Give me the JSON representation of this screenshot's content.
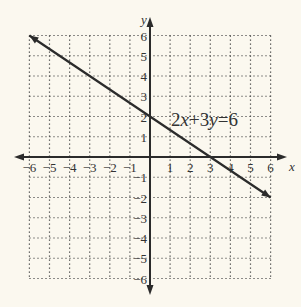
{
  "chart_data": {
    "type": "line",
    "title": "",
    "xlabel": "x",
    "ylabel": "y",
    "xlim": [
      -6,
      6
    ],
    "ylim": [
      -6,
      6
    ],
    "grid": true,
    "grid_style": "dotted",
    "x_ticks": [
      -6,
      -5,
      -4,
      -3,
      -2,
      -1,
      1,
      2,
      3,
      4,
      5,
      6
    ],
    "y_ticks": [
      -6,
      -5,
      -4,
      -3,
      -2,
      -1,
      1,
      2,
      3,
      4,
      5,
      6
    ],
    "x_tick_labels": [
      "−6",
      "−5",
      "−4",
      "−3",
      "−2",
      "−1",
      "1",
      "2",
      "3",
      "4",
      "5",
      "6"
    ],
    "y_tick_labels": [
      "−6",
      "−5",
      "−4",
      "−3",
      "−2",
      "−1",
      "1",
      "2",
      "3",
      "4",
      "5",
      "6"
    ],
    "series": [
      {
        "name": "2x+3y=6",
        "x": [
          -6,
          0,
          3,
          6
        ],
        "y": [
          6,
          2,
          0,
          -2
        ]
      }
    ],
    "annotations": [
      {
        "text": "2x+3y=6",
        "x": 1,
        "y": 1.6
      }
    ],
    "colors": {
      "background": "#fbf8ef",
      "ink": "#2b2b2b"
    }
  }
}
